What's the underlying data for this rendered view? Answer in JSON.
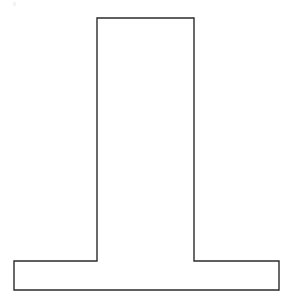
{
  "document": {
    "title": "T-Shape Outline Drawing",
    "kind": "line-drawing",
    "background_color": "#ffffff",
    "canvas": {
      "width": 294,
      "height": 305
    }
  },
  "figure": {
    "name": "inverted-t-pedestal-outline",
    "fill_color": "#ffffff",
    "stroke_color": "#2b2b2b",
    "stroke_width": 1.4,
    "closed": true,
    "vertex_count": 8,
    "polygon_points": "97,18 194,18 194,261 279,261 279,290 14,290 14,261 97,261",
    "vertices": [
      {
        "id": "stem-top-left",
        "x": 97,
        "y": 18
      },
      {
        "id": "stem-top-right",
        "x": 194,
        "y": 18
      },
      {
        "id": "stem-right-base-junction",
        "x": 194,
        "y": 261
      },
      {
        "id": "base-top-right",
        "x": 279,
        "y": 261
      },
      {
        "id": "base-bottom-right",
        "x": 279,
        "y": 290
      },
      {
        "id": "base-bottom-left",
        "x": 14,
        "y": 290
      },
      {
        "id": "base-top-left",
        "x": 14,
        "y": 261
      },
      {
        "id": "stem-left-base-junction",
        "x": 97,
        "y": 261
      }
    ],
    "measurements": {
      "stem_width": 97,
      "stem_height": 243,
      "base_width": 265,
      "base_height": 29,
      "total_height": 272
    }
  },
  "artifacts": [
    {
      "id": "speck-top-left",
      "x": 13,
      "y": 2,
      "width": 3,
      "height": 4
    }
  ]
}
